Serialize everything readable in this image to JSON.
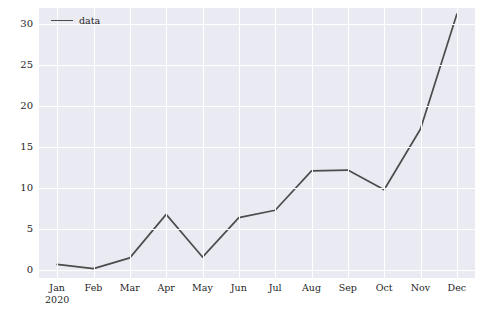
{
  "chart_data": {
    "type": "line",
    "title": "",
    "xlabel": "",
    "ylabel": "",
    "categories": [
      "Jan 2020",
      "Feb",
      "Mar",
      "Apr",
      "May",
      "Jun",
      "Jul",
      "Aug",
      "Sep",
      "Oct",
      "Nov",
      "Dec"
    ],
    "x_tick_labels": [
      {
        "main": "Jan",
        "sub": "2020"
      },
      {
        "main": "Feb",
        "sub": ""
      },
      {
        "main": "Mar",
        "sub": ""
      },
      {
        "main": "Apr",
        "sub": ""
      },
      {
        "main": "May",
        "sub": ""
      },
      {
        "main": "Jun",
        "sub": ""
      },
      {
        "main": "Jul",
        "sub": ""
      },
      {
        "main": "Aug",
        "sub": ""
      },
      {
        "main": "Sep",
        "sub": ""
      },
      {
        "main": "Oct",
        "sub": ""
      },
      {
        "main": "Nov",
        "sub": ""
      },
      {
        "main": "Dec",
        "sub": ""
      }
    ],
    "values": [
      0.7,
      0.2,
      1.5,
      6.8,
      1.6,
      6.4,
      7.3,
      12.1,
      12.2,
      9.8,
      17.2,
      31.2
    ],
    "series": [
      {
        "name": "data",
        "values": [
          0.7,
          0.2,
          1.5,
          6.8,
          1.6,
          6.4,
          7.3,
          12.1,
          12.2,
          9.8,
          17.2,
          31.2
        ]
      }
    ],
    "y_tick_labels": [
      "0",
      "5",
      "10",
      "15",
      "20",
      "25",
      "30"
    ],
    "y_ticks": [
      0,
      5,
      10,
      15,
      20,
      25,
      30
    ],
    "ylim": [
      -0.95,
      31.95
    ],
    "xlim": [
      -0.5,
      11.5
    ],
    "grid": true,
    "legend": {
      "entries": [
        "data"
      ],
      "position": "upper left"
    },
    "colors": {
      "line": "#4c4c4c",
      "plot_background": "#eaeaf2",
      "grid": "#ffffff",
      "tick_label": "#262626",
      "figure_background": "#ffffff"
    }
  }
}
